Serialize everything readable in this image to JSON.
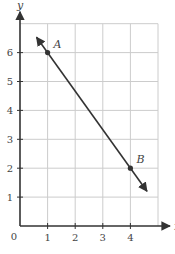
{
  "chart_data": {
    "type": "line",
    "title": "",
    "xlabel": "x",
    "ylabel": "y",
    "xlim": [
      0,
      5
    ],
    "ylim": [
      0,
      7
    ],
    "grid": true,
    "x_ticks": [
      1,
      2,
      3,
      4
    ],
    "y_ticks": [
      1,
      2,
      3,
      4,
      5,
      6
    ],
    "origin_label": "0",
    "points": [
      {
        "label": "A",
        "x": 1,
        "y": 6
      },
      {
        "label": "B",
        "x": 4,
        "y": 2
      }
    ],
    "line": {
      "through": [
        "A",
        "B"
      ],
      "slope": -1.3333,
      "arrows": "both",
      "extent_x": [
        0.6,
        4.6
      ]
    },
    "colors": {
      "grid": "#cccccc",
      "axis": "#333333",
      "line": "#333333"
    }
  }
}
